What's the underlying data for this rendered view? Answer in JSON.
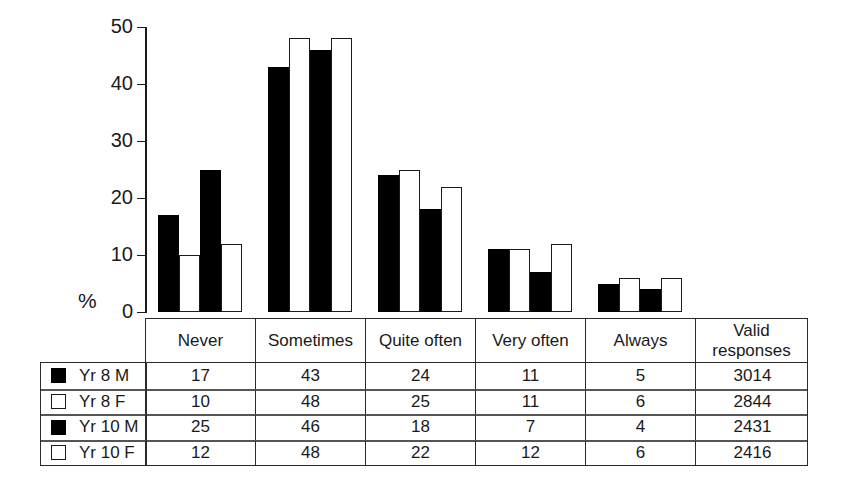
{
  "chart_data": {
    "type": "bar",
    "title": "",
    "xlabel": "",
    "ylabel": "%",
    "ylim": [
      0,
      50
    ],
    "yticks": [
      0,
      10,
      20,
      30,
      40,
      50
    ],
    "grid": false,
    "legend_position": "table-left-column",
    "categories": [
      "Never",
      "Sometimes",
      "Quite often",
      "Very often",
      "Always"
    ],
    "series": [
      {
        "name": "Yr 8 M",
        "style": "filled",
        "values": [
          17,
          43,
          24,
          11,
          5
        ],
        "valid_responses": 3014
      },
      {
        "name": "Yr 8 F",
        "style": "hollow",
        "values": [
          10,
          48,
          25,
          11,
          6
        ],
        "valid_responses": 2844
      },
      {
        "name": "Yr 10 M",
        "style": "filled",
        "values": [
          25,
          46,
          18,
          7,
          4
        ],
        "valid_responses": 2431
      },
      {
        "name": "Yr 10 F",
        "style": "hollow",
        "values": [
          12,
          48,
          22,
          12,
          6
        ],
        "valid_responses": 2416
      }
    ]
  },
  "axis": {
    "unit_label": "%",
    "tick_labels": [
      "50",
      "40",
      "30",
      "20",
      "10",
      "0"
    ]
  },
  "table": {
    "column_headers": [
      "Never",
      "Sometimes",
      "Quite often",
      "Very often",
      "Valid responses"
    ],
    "headers": {
      "never": "Never",
      "sometimes": "Sometimes",
      "quite_often": "Quite often",
      "very_often": "Very often",
      "always": "Always",
      "valid_line1": "Valid",
      "valid_line2": "responses"
    },
    "rows": [
      {
        "label": "Yr 8 M",
        "swatch": "filled",
        "never": "17",
        "sometimes": "43",
        "quite_often": "24",
        "very_often": "11",
        "always": "5",
        "valid": "3014"
      },
      {
        "label": "Yr 8 F",
        "swatch": "hollow",
        "never": "10",
        "sometimes": "48",
        "quite_often": "25",
        "very_often": "11",
        "always": "6",
        "valid": "2844"
      },
      {
        "label": "Yr 10 M",
        "swatch": "filled",
        "never": "25",
        "sometimes": "46",
        "quite_often": "18",
        "very_often": "7",
        "always": "4",
        "valid": "2431"
      },
      {
        "label": "Yr 10 F",
        "swatch": "hollow",
        "never": "12",
        "sometimes": "48",
        "quite_often": "22",
        "very_often": "12",
        "always": "6",
        "valid": "2416"
      }
    ]
  },
  "colors": {
    "filled_bar": "#000000",
    "hollow_bar": "#ffffff",
    "outline": "#1a1a1a",
    "background": "#ffffff"
  }
}
